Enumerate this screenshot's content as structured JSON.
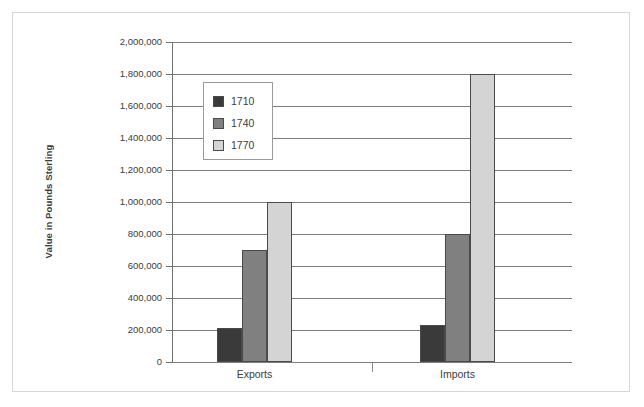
{
  "chart_data": {
    "type": "bar",
    "title": "",
    "xlabel": "",
    "ylabel": "Value in Pounds Sterling",
    "categories": [
      "Exports",
      "Imports"
    ],
    "ylim": [
      0,
      2000000
    ],
    "y_ticks": [
      "0",
      "200,000",
      "400,000",
      "600,000",
      "800,000",
      "1,000,000",
      "1,200,000",
      "1,400,000",
      "1,600,000",
      "1,800,000",
      "2,000,000"
    ],
    "y_tick_values": [
      0,
      200000,
      400000,
      600000,
      800000,
      1000000,
      1200000,
      1400000,
      1600000,
      1800000,
      2000000
    ],
    "grid": true,
    "legend_position": "upper-left-inside",
    "series": [
      {
        "name": "1710",
        "color": "#3a3a3a",
        "values": [
          210000,
          230000
        ]
      },
      {
        "name": "1740",
        "color": "#808080",
        "values": [
          700000,
          800000
        ]
      },
      {
        "name": "1770",
        "color": "#d4d4d4",
        "values": [
          1000000,
          1800000
        ]
      }
    ]
  }
}
